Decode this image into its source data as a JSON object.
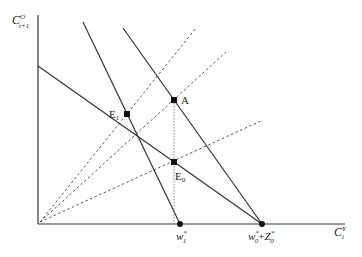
{
  "axes": {
    "y_label": {
      "base": "C",
      "sup": "O",
      "sub": "t+1"
    },
    "x_label": {
      "base": "C",
      "sup": "Y",
      "sub": "t"
    }
  },
  "points": {
    "A": {
      "label": "A"
    },
    "E1": {
      "label": "E",
      "sub": "1"
    },
    "E0": {
      "label": "E",
      "sub": "0"
    }
  },
  "ticks": {
    "w1": {
      "base": "w",
      "sup": "*",
      "sub": "1"
    },
    "w0Z0": {
      "w": "w",
      "w_sup": "*",
      "w_sub": "0",
      "plus": "+",
      "z": "Z",
      "z_sup": "*",
      "z_sub": "0"
    }
  },
  "colors": {
    "line": "#333333",
    "dashed": "#555555",
    "dot": "#111111"
  }
}
